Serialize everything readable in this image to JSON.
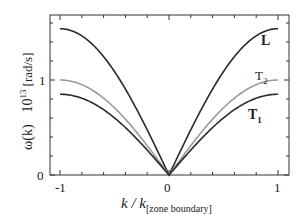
{
  "chart_data": {
    "type": "line",
    "title": "",
    "xlabel": "k / k",
    "xlabel_subscript": "[zone boundary]",
    "ylabel": "ω(k)",
    "ylabel_unit": "10",
    "ylabel_unit_exp": "13",
    "ylabel_unit_suffix": "[rad/s]",
    "xlim": [
      -1.1,
      1.1
    ],
    "ylim": [
      0,
      1.68
    ],
    "x_ticks": [
      -1,
      0,
      1
    ],
    "x_tick_labels": [
      "-1",
      "0",
      "1"
    ],
    "y_ticks": [
      0,
      1
    ],
    "y_tick_labels": [
      "0",
      "1"
    ],
    "grid": false,
    "legend_position": "inline labels at right end of curves",
    "series": [
      {
        "name": "L",
        "label": "L",
        "color": "#2a2a2a",
        "max": 1.54
      },
      {
        "name": "T2",
        "label": "T",
        "label_sub": "2",
        "color": "#9a9a9a",
        "max": 1.0
      },
      {
        "name": "T1",
        "label": "T",
        "label_sub": "1",
        "color": "#2a2a2a",
        "max": 0.85
      }
    ],
    "x": [
      -1,
      -0.75,
      -0.5,
      -0.25,
      0,
      0.25,
      0.5,
      0.75,
      1
    ],
    "note": "Dispersion curves ω(k)=ω_max·|sin(πk/2)|, symmetric about k=0"
  }
}
